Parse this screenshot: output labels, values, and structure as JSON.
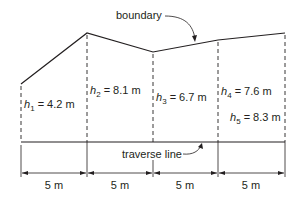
{
  "diagram": {
    "labels": {
      "boundary": "boundary",
      "traverse": "traverse line"
    },
    "offsets": [
      {
        "sym": "h",
        "sub": "1",
        "val": " = 4.2 m"
      },
      {
        "sym": "h",
        "sub": "2",
        "val": " = 8.1 m"
      },
      {
        "sym": "h",
        "sub": "3",
        "val": " = 6.7 m"
      },
      {
        "sym": "h",
        "sub": "4",
        "val": " = 7.6 m"
      },
      {
        "sym": "h",
        "sub": "5",
        "val": " = 8.3 m"
      }
    ],
    "intervals": [
      "5 m",
      "5 m",
      "5 m",
      "5 m"
    ],
    "colors": {
      "line": "#231f20"
    }
  }
}
